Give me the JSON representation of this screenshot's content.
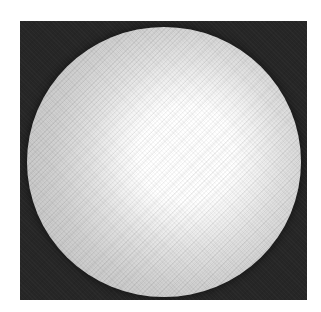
{
  "image": {
    "description": "Grayscale circular bright disc (illumination spot) on a dark square background",
    "colors": {
      "page_background": "#ffffff",
      "frame_background": "#262626",
      "disc_core": "#ffffff",
      "disc_mid": "#d0d0d0",
      "disc_rim": "#3a3a3a"
    },
    "frame": {
      "left": 20,
      "top": 21,
      "width": 287,
      "height": 279
    },
    "disc": {
      "center_x": 164,
      "center_y": 161,
      "radius_x": 137,
      "radius_y": 135
    },
    "bright_core": {
      "center_x": 167,
      "center_y": 152,
      "radius": 65
    }
  }
}
